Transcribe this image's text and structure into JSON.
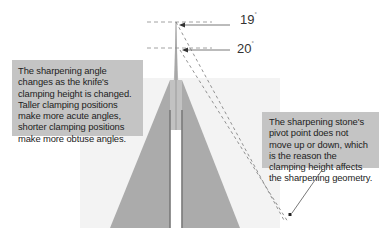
{
  "diagram": {
    "angles": [
      {
        "value": "19",
        "unit": "°",
        "level": "upper clamping position"
      },
      {
        "value": "20",
        "unit": "°",
        "level": "lower clamping position"
      }
    ],
    "callouts": {
      "left": "The sharpening angle changes as the knife's clamping height is changed. Taller clamping positions make more acute angles, shorter clamping positions make more obtuse angles.",
      "right": "The sharpening stone's pivot point does not move up or down, which is the reason the clamping height affects the sharpening geometry."
    },
    "colors": {
      "background": "#ffffff",
      "background_panel": "#f2f2f2",
      "blade": "#a9a9a9",
      "blade_spine": "#7a7a7a",
      "callout_fill": "#c4c4c4",
      "line": "#555555",
      "dash": "#8a8a8a"
    }
  }
}
